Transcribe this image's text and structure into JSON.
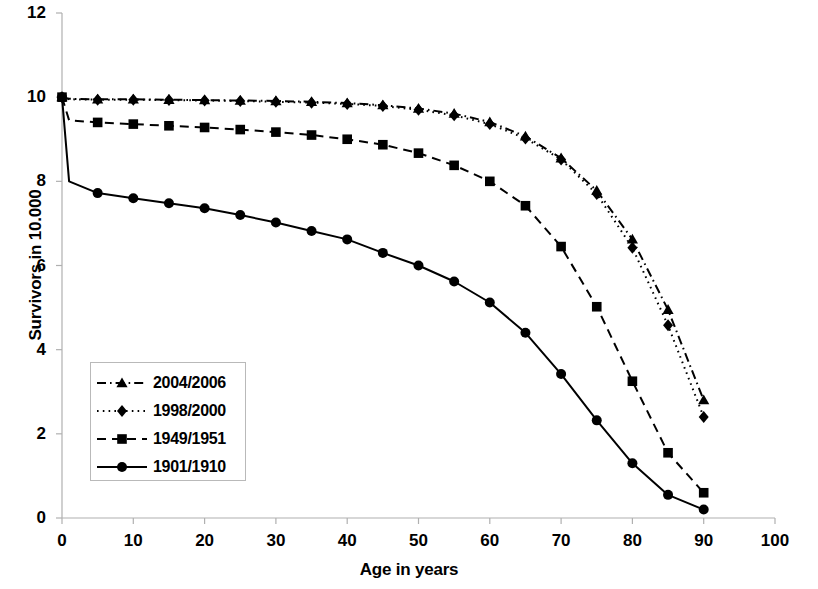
{
  "chart_data": {
    "type": "line",
    "title": "",
    "xlabel": "Age in years",
    "ylabel": "Survivors in 10.000",
    "xlim": [
      0,
      100
    ],
    "ylim": [
      0,
      12
    ],
    "xticks": [
      0,
      10,
      20,
      30,
      40,
      50,
      60,
      70,
      80,
      90,
      100
    ],
    "yticks": [
      0,
      2,
      4,
      6,
      8,
      10,
      12
    ],
    "grid": false,
    "legend_position": "center-left",
    "x": [
      0,
      1,
      5,
      10,
      15,
      20,
      25,
      30,
      35,
      40,
      45,
      50,
      55,
      60,
      65,
      70,
      75,
      80,
      85,
      90
    ],
    "series": [
      {
        "name": "2004/2006",
        "marker": "triangle",
        "linestyle": "dash-dot",
        "color": "#000000",
        "values": [
          10.0,
          9.96,
          9.95,
          9.95,
          9.94,
          9.93,
          9.92,
          9.91,
          9.89,
          9.86,
          9.81,
          9.73,
          9.61,
          9.41,
          9.07,
          8.55,
          7.78,
          6.62,
          4.95,
          2.8
        ]
      },
      {
        "name": "1998/2000",
        "marker": "diamond",
        "linestyle": "dotted",
        "color": "#000000",
        "values": [
          10.0,
          9.95,
          9.94,
          9.94,
          9.93,
          9.92,
          9.91,
          9.89,
          9.87,
          9.84,
          9.79,
          9.7,
          9.57,
          9.36,
          9.02,
          8.52,
          7.7,
          6.42,
          4.58,
          2.4
        ]
      },
      {
        "name": "1949/1951",
        "marker": "square",
        "linestyle": "dashed",
        "color": "#000000",
        "values": [
          10.0,
          9.45,
          9.4,
          9.36,
          9.32,
          9.28,
          9.23,
          9.17,
          9.1,
          9.0,
          8.87,
          8.67,
          8.38,
          8.0,
          7.42,
          6.45,
          5.02,
          3.25,
          1.55,
          0.6
        ]
      },
      {
        "name": "1901/1910",
        "marker": "circle",
        "linestyle": "solid",
        "color": "#000000",
        "values": [
          10.0,
          8.0,
          7.72,
          7.6,
          7.48,
          7.36,
          7.2,
          7.02,
          6.82,
          6.62,
          6.3,
          6.0,
          5.62,
          5.12,
          4.4,
          3.42,
          2.32,
          1.3,
          0.55,
          0.2
        ]
      }
    ]
  },
  "axes": {
    "x_label": "Age in years",
    "y_label": "Survivors in 10.000",
    "x_tick_labels": [
      "0",
      "10",
      "20",
      "30",
      "40",
      "50",
      "60",
      "70",
      "80",
      "90",
      "100"
    ],
    "y_tick_labels": [
      "0",
      "2",
      "4",
      "6",
      "8",
      "10",
      "12"
    ]
  },
  "legend": {
    "entries": [
      {
        "label": "2004/2006",
        "marker": "triangle-marker",
        "style": "dash-dot"
      },
      {
        "label": "1998/2000",
        "marker": "diamond-marker",
        "style": "dotted"
      },
      {
        "label": "1949/1951",
        "marker": "square-marker",
        "style": "dashed"
      },
      {
        "label": "1901/1910",
        "marker": "circle-marker",
        "style": "solid"
      }
    ]
  },
  "style": {
    "axis_color": "#b0b0b0",
    "line_color": "#000000",
    "background": "#ffffff"
  }
}
